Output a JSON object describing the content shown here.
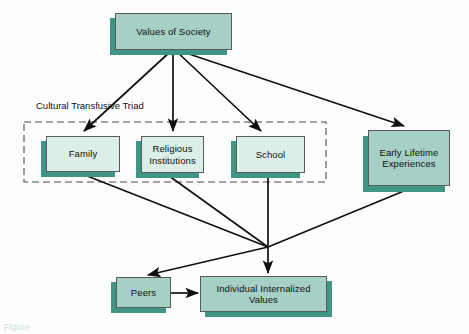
{
  "diagram": {
    "type": "flow-diagram",
    "colors": {
      "box_fill_dark": "#a6cfc5",
      "box_fill_light": "#dceee8",
      "box_shadow": "#3f9684",
      "box_border": "#5a5a5a",
      "arrow": "#111111",
      "dashed_group": "#4a4a4a",
      "background": "#fdfdfd"
    },
    "group_label": "Cultural Transfusive Triad",
    "caption": "Figure",
    "nodes": [
      {
        "id": "values_of_society",
        "label": "Values of Society",
        "x": 115,
        "y": 13,
        "w": 117,
        "h": 37,
        "fill": "dark"
      },
      {
        "id": "family",
        "label": "Family",
        "x": 46,
        "y": 136,
        "w": 74,
        "h": 36,
        "fill": "light"
      },
      {
        "id": "religious",
        "label": "Religious Institutions",
        "x": 141,
        "y": 136,
        "w": 63,
        "h": 37,
        "fill": "light"
      },
      {
        "id": "school",
        "label": "School",
        "x": 236,
        "y": 136,
        "w": 69,
        "h": 37,
        "fill": "light"
      },
      {
        "id": "early_lifetime",
        "label": "Early Lifetime Experiences",
        "x": 368,
        "y": 130,
        "w": 82,
        "h": 56,
        "fill": "dark"
      },
      {
        "id": "peers",
        "label": "Peers",
        "x": 116,
        "y": 277,
        "w": 55,
        "h": 31,
        "fill": "dark"
      },
      {
        "id": "individual_values",
        "label": "Individual Internalized Values",
        "x": 200,
        "y": 276,
        "w": 127,
        "h": 36,
        "fill": "dark"
      }
    ],
    "group_box": {
      "x": 24,
      "y": 122,
      "w": 302,
      "h": 60,
      "dashed": true
    },
    "edges": [
      {
        "from": "values_of_society",
        "to": "family",
        "kind": "arrow"
      },
      {
        "from": "values_of_society",
        "to": "religious",
        "kind": "arrow"
      },
      {
        "from": "values_of_society",
        "to": "school",
        "kind": "arrow"
      },
      {
        "from": "values_of_society",
        "to": "early_lifetime",
        "kind": "arrow"
      },
      {
        "from": "family",
        "to": "junction",
        "kind": "line"
      },
      {
        "from": "religious",
        "to": "junction",
        "kind": "line"
      },
      {
        "from": "early_lifetime",
        "to": "junction",
        "kind": "line"
      },
      {
        "from": "junction",
        "to": "peers",
        "kind": "arrow"
      },
      {
        "from": "school",
        "to": "individual_values",
        "kind": "arrow"
      },
      {
        "from": "junction",
        "to": "individual_values",
        "kind": "arrow"
      },
      {
        "from": "peers",
        "to": "individual_values",
        "kind": "arrow"
      }
    ],
    "junction": {
      "x": 268,
      "y": 247
    }
  }
}
